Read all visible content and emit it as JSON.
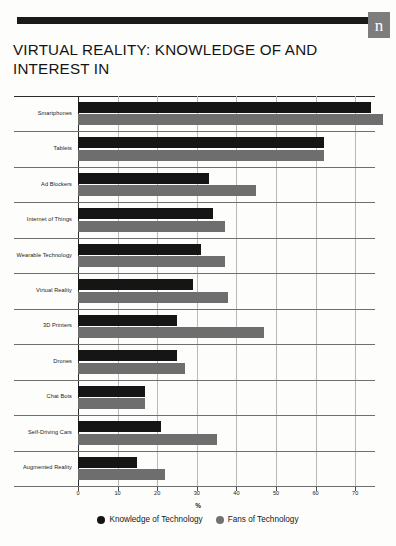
{
  "header": {
    "logo_letter": "n"
  },
  "title": "VIRTUAL REALITY: KNOWLEDGE OF AND INTEREST IN",
  "legend": {
    "knowledge_label": "Knowledge of Technology",
    "fans_label": "Fans of Technology",
    "knowledge_color": "#141414",
    "fans_color": "#717171"
  },
  "chart_data": {
    "type": "bar",
    "orientation": "horizontal",
    "title": "VIRTUAL REALITY: KNOWLEDGE OF AND INTEREST IN",
    "xlabel": "%",
    "ylabel": "",
    "xlim": [
      0,
      75
    ],
    "xticks": [
      0,
      10,
      20,
      30,
      40,
      50,
      60,
      70
    ],
    "xticklabels": [
      "0",
      "10",
      "20",
      "30",
      "40",
      "50",
      "60",
      "70"
    ],
    "grid": true,
    "legend_position": "bottom-center",
    "categories": [
      "Smartphones",
      "Tablets",
      "Ad Blockers",
      "Internet of Things",
      "Wearable Technology",
      "Virtual Reality",
      "3D Printers",
      "Drones",
      "Chat Bots",
      "Self-Driving Cars",
      "Augmented Reality"
    ],
    "series": [
      {
        "name": "Knowledge of Technology",
        "color": "#151515",
        "values": [
          74,
          62,
          33,
          34,
          31,
          29,
          25,
          25,
          17,
          21,
          15
        ]
      },
      {
        "name": "Fans of Technology",
        "color": "#6e6e6e",
        "values": [
          77,
          62,
          45,
          37,
          37,
          38,
          47,
          27,
          17,
          35,
          22
        ]
      }
    ]
  }
}
